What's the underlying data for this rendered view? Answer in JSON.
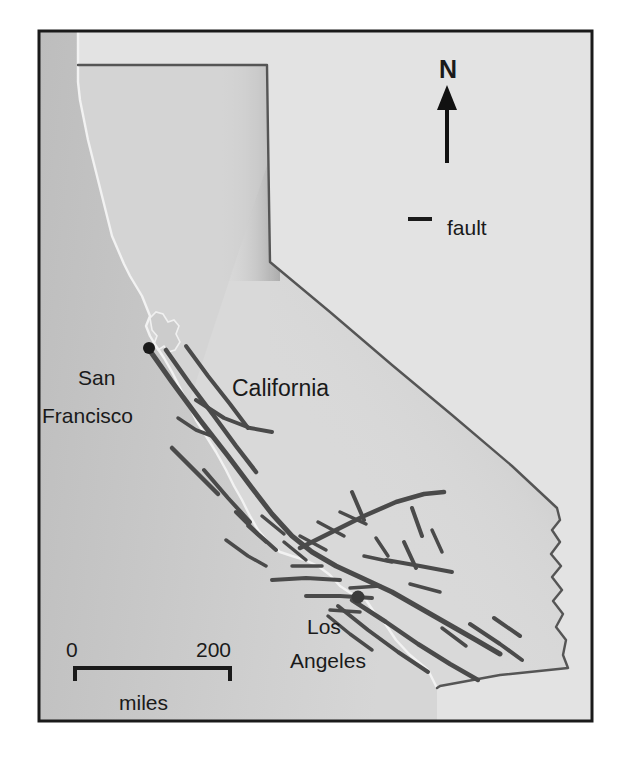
{
  "figure": {
    "kind": "reference-map",
    "frame_border_color": "#1a1a1a",
    "background_color": "#ffffff"
  },
  "map": {
    "state_label": "California",
    "cities": [
      {
        "name": "san-francisco",
        "line1": "San",
        "line2": "Francisco"
      },
      {
        "name": "los-angeles",
        "line1": "Los",
        "line2": "Angeles"
      }
    ],
    "colors": {
      "ocean_fill": "#c9c9c9",
      "outside_fill": "#e3e3e3",
      "state_fill": "#d9d9d9",
      "state_border": "#555555",
      "coastline": "#f2f2f2",
      "fault_line": "#4a4a4a",
      "city_dot": "#1a1a1a"
    }
  },
  "legend": {
    "north": {
      "label": "N",
      "icon": "north-arrow-icon"
    },
    "fault": {
      "label": "fault",
      "icon": "fault-line-swatch"
    }
  },
  "scale_bar": {
    "min_label": "0",
    "max_label": "200",
    "unit_label": "miles",
    "span_miles": 200
  }
}
